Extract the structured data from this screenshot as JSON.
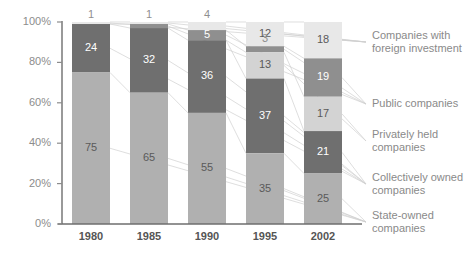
{
  "chart_data": {
    "type": "bar",
    "subtype": "stacked-100-percent",
    "title": "",
    "xlabel": "",
    "ylabel": "",
    "categories": [
      "1980",
      "1985",
      "1990",
      "1995",
      "2002"
    ],
    "ylim": [
      0,
      100
    ],
    "ytick_labels": [
      "0%",
      "20%",
      "40%",
      "60%",
      "80%",
      "100%"
    ],
    "ytick_values": [
      0,
      20,
      40,
      60,
      80,
      100
    ],
    "grid": false,
    "legend_position": "right",
    "series": [
      {
        "name": "Companies with foreign investment",
        "color": "#e8e8e8",
        "label_color": "dark",
        "values": [
          1,
          1,
          4,
          12,
          18
        ],
        "value_labels": [
          "1",
          "1",
          "4",
          "12",
          "18"
        ]
      },
      {
        "name": "Public companies",
        "color": "#8f8f8f",
        "label_color": "light",
        "values": [
          0,
          2,
          5,
          3,
          19
        ],
        "value_labels": [
          "",
          "",
          "5",
          "3",
          "19"
        ]
      },
      {
        "name": "Privately held companies",
        "color": "#d3d3d3",
        "label_color": "dark",
        "values": [
          0,
          0,
          0,
          13,
          17
        ],
        "value_labels": [
          "",
          "",
          "",
          "13",
          "17"
        ]
      },
      {
        "name": "Collectively owned companies",
        "color": "#6f6f6f",
        "label_color": "light",
        "values": [
          24,
          32,
          36,
          37,
          21
        ],
        "value_labels": [
          "24",
          "32",
          "36",
          "37",
          "21"
        ]
      },
      {
        "name": "State-owned companies",
        "color": "#b0b0b0",
        "label_color": "dark",
        "values": [
          75,
          65,
          55,
          35,
          25
        ],
        "value_labels": [
          "75",
          "65",
          "55",
          "35",
          "25"
        ]
      }
    ]
  },
  "legend": {
    "entries": [
      {
        "line1": "Companies with",
        "line2": "foreign investment"
      },
      {
        "line1": "Public companies",
        "line2": ""
      },
      {
        "line1": "Privately held",
        "line2": "companies"
      },
      {
        "line1": "Collectively owned",
        "line2": "companies"
      },
      {
        "line1": "State-owned",
        "line2": "companies"
      }
    ]
  },
  "colors": {
    "axis": "#6e6e6e",
    "tick_text": "#8c8c8c",
    "category_text": "#555555",
    "legend_text": "#8a8a8a",
    "connector": "#d0d0d0"
  }
}
